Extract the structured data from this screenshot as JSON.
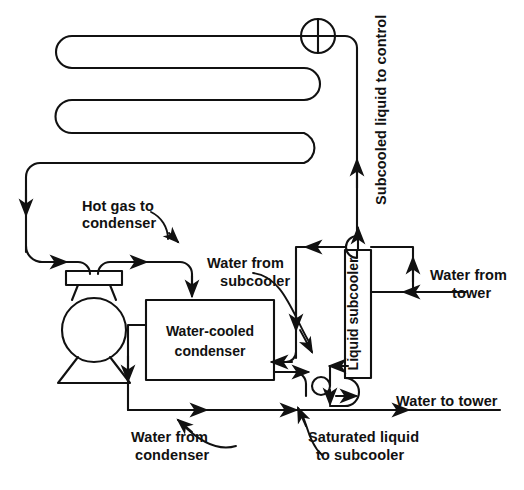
{
  "diagram": {
    "background_color": "#ffffff",
    "line_color": "#111111",
    "text_color": "#111111"
  },
  "components": {
    "compressor": {
      "name": "compressor",
      "shape": "flask-with-base"
    },
    "condenser": {
      "label_line1": "Water-cooled",
      "label_line2": "condenser"
    },
    "subcooler": {
      "label": "Liquid subcooler",
      "orientation": "vertical"
    },
    "coil": {
      "name": "evaporator-serpentine-coil",
      "passes": 3
    },
    "valve": {
      "name": "crossed-circle-valve"
    }
  },
  "labels": {
    "hot_gas": {
      "line1": "Hot gas to",
      "line2": "condenser"
    },
    "water_from_subcooler": {
      "line1": "Water from",
      "line2": "subcooler"
    },
    "subcooled_liquid": "Subcooled liquid to control",
    "water_from_tower": {
      "line1": "Water from",
      "line2": "tower"
    },
    "water_to_tower": "Water to tower",
    "water_from_condenser": {
      "line1": "Water from",
      "line2": "condenser"
    },
    "saturated_liquid": {
      "line1": "Saturated liquid",
      "line2": "to subcooler"
    }
  }
}
